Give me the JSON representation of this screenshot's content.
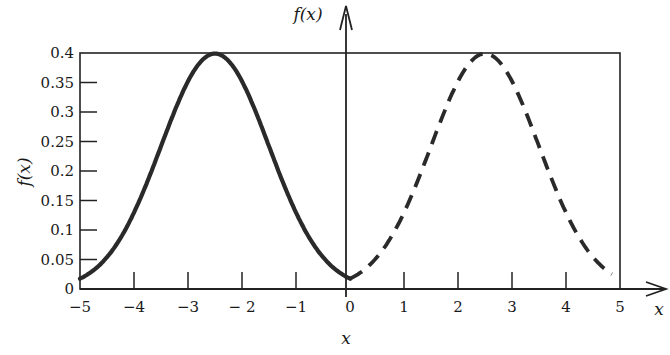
{
  "chart_data": {
    "type": "line",
    "title": "",
    "xlabel": "x",
    "ylabel": "f(x)",
    "axis_arrow_labels": {
      "x": "x",
      "y": "f(x)"
    },
    "xlim": [
      -5,
      5
    ],
    "ylim": [
      0,
      0.4
    ],
    "xticks": [
      -5,
      -4,
      -3,
      -2,
      -1,
      0,
      1,
      2,
      3,
      4,
      5
    ],
    "xtick_labels": [
      "−5",
      "−4",
      "−3",
      "− 2",
      "−1",
      "0",
      "1",
      "2",
      "3",
      "4",
      "5"
    ],
    "yticks": [
      0,
      0.05,
      0.1,
      0.15,
      0.2,
      0.25,
      0.3,
      0.35,
      0.4
    ],
    "ytick_labels": [
      "0",
      "0.05",
      "0.1",
      "0.15",
      "0.2",
      "0.25",
      "0.3",
      "0.35",
      "0.4"
    ],
    "grid": false,
    "legend": null,
    "series": [
      {
        "name": "solid curve (normal, mean -2.5, sd 1)",
        "style": "solid",
        "mean": -2.5,
        "sd": 1,
        "x": [
          -5,
          -4.5,
          -4,
          -3.5,
          -3,
          -2.5,
          -2,
          -1.5,
          -1,
          -0.5,
          0
        ],
        "values": [
          0.018,
          0.054,
          0.13,
          0.242,
          0.352,
          0.399,
          0.352,
          0.242,
          0.13,
          0.054,
          0.018
        ]
      },
      {
        "name": "dashed curve (normal, mean 2.5, sd 1)",
        "style": "dashed",
        "mean": 2.5,
        "sd": 1,
        "x": [
          0,
          0.5,
          1,
          1.5,
          2,
          2.5,
          3,
          3.5,
          4,
          4.5,
          5
        ],
        "values": [
          0.018,
          0.054,
          0.13,
          0.242,
          0.352,
          0.399,
          0.352,
          0.242,
          0.13,
          0.054,
          0.018
        ]
      }
    ]
  }
}
